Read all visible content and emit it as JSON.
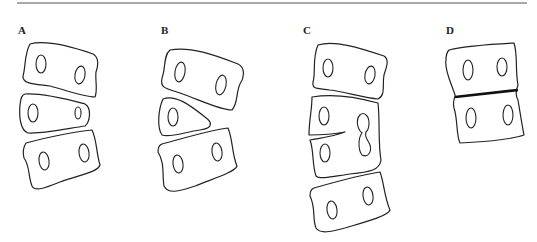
{
  "figure": {
    "panels": [
      {
        "id": "A",
        "label": "A"
      },
      {
        "id": "B",
        "label": "B"
      },
      {
        "id": "C",
        "label": "C"
      },
      {
        "id": "D",
        "label": "D"
      }
    ],
    "colors": {
      "line": "#222222",
      "background": "#ffffff"
    }
  }
}
